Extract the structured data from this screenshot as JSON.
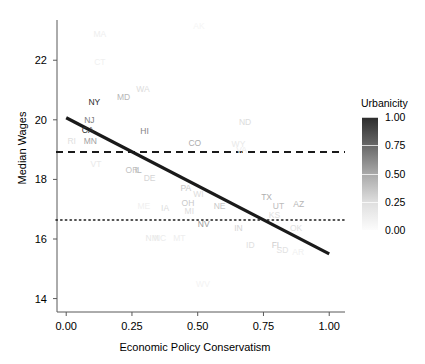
{
  "chart_data": {
    "type": "scatter",
    "title": "",
    "xlabel": "Economic Policy Conservatism",
    "ylabel": "Median Wages",
    "xlim": [
      -0.035,
      1.06
    ],
    "ylim": [
      13.55,
      23.35
    ],
    "xticks": [
      0.0,
      0.25,
      0.5,
      0.75,
      1.0
    ],
    "xticklabels": [
      "0.00",
      "0.25",
      "0.50",
      "0.75",
      "1.00"
    ],
    "yticks": [
      14,
      16,
      18,
      20,
      22
    ],
    "yticklabels": [
      "14",
      "16",
      "18",
      "20",
      "22"
    ],
    "grid": false,
    "legend": {
      "title": "Urbanicity",
      "position": "right",
      "type": "colorbar",
      "ticks": [
        1.0,
        0.75,
        0.5,
        0.25,
        0.0
      ],
      "ticklabels": [
        "1.00",
        "0.75",
        "0.50",
        "0.25",
        "0.00"
      ],
      "color_low": "#fcfcfc",
      "color_high": "#2b2b2b"
    },
    "marker_type": "text-label",
    "points": [
      {
        "label": "AK",
        "x": 0.505,
        "y": 23.15,
        "urbanicity": 0.03
      },
      {
        "label": "MA",
        "x": 0.128,
        "y": 22.88,
        "urbanicity": 0.06
      },
      {
        "label": "CT",
        "x": 0.128,
        "y": 21.95,
        "urbanicity": 0.05
      },
      {
        "label": "WA",
        "x": 0.292,
        "y": 21.05,
        "urbanicity": 0.14
      },
      {
        "label": "MD",
        "x": 0.218,
        "y": 20.75,
        "urbanicity": 0.3
      },
      {
        "label": "NY",
        "x": 0.107,
        "y": 20.6,
        "urbanicity": 0.9
      },
      {
        "label": "NJ",
        "x": 0.088,
        "y": 20.0,
        "urbanicity": 0.55
      },
      {
        "label": "ND",
        "x": 0.68,
        "y": 19.92,
        "urbanicity": 0.14
      },
      {
        "label": "CA",
        "x": 0.082,
        "y": 19.65,
        "urbanicity": 0.88
      },
      {
        "label": "HI",
        "x": 0.298,
        "y": 19.62,
        "urbanicity": 0.52
      },
      {
        "label": "RI",
        "x": 0.021,
        "y": 19.28,
        "urbanicity": 0.12
      },
      {
        "label": "MN",
        "x": 0.092,
        "y": 19.28,
        "urbanicity": 0.4
      },
      {
        "label": "CO",
        "x": 0.489,
        "y": 19.22,
        "urbanicity": 0.34
      },
      {
        "label": "WY",
        "x": 0.655,
        "y": 19.18,
        "urbanicity": 0.08
      },
      {
        "label": "VA",
        "x": 0.667,
        "y": 19.0,
        "urbanicity": 0.07
      },
      {
        "label": "VT",
        "x": 0.113,
        "y": 18.52,
        "urbanicity": 0.08
      },
      {
        "label": "OR",
        "x": 0.25,
        "y": 18.33,
        "urbanicity": 0.25
      },
      {
        "label": "IL",
        "x": 0.274,
        "y": 18.33,
        "urbanicity": 0.3
      },
      {
        "label": "DE",
        "x": 0.317,
        "y": 18.05,
        "urbanicity": 0.17
      },
      {
        "label": "PA",
        "x": 0.455,
        "y": 17.72,
        "urbanicity": 0.22
      },
      {
        "label": "WI",
        "x": 0.503,
        "y": 17.5,
        "urbanicity": 0.14
      },
      {
        "label": "TX",
        "x": 0.762,
        "y": 17.42,
        "urbanicity": 0.33
      },
      {
        "label": "AZ",
        "x": 0.884,
        "y": 17.18,
        "urbanicity": 0.3
      },
      {
        "label": "UT",
        "x": 0.807,
        "y": 17.12,
        "urbanicity": 0.28
      },
      {
        "label": "OH",
        "x": 0.463,
        "y": 17.22,
        "urbanicity": 0.22
      },
      {
        "label": "NE",
        "x": 0.583,
        "y": 17.12,
        "urbanicity": 0.22
      },
      {
        "label": "IA",
        "x": 0.376,
        "y": 17.05,
        "urbanicity": 0.14
      },
      {
        "label": "ME",
        "x": 0.295,
        "y": 17.1,
        "urbanicity": 0.05
      },
      {
        "label": "MI",
        "x": 0.468,
        "y": 16.93,
        "urbanicity": 0.14
      },
      {
        "label": "KS",
        "x": 0.792,
        "y": 16.82,
        "urbanicity": 0.12
      },
      {
        "label": "NV",
        "x": 0.523,
        "y": 16.52,
        "urbanicity": 0.42
      },
      {
        "label": "IN",
        "x": 0.655,
        "y": 16.38,
        "urbanicity": 0.17
      },
      {
        "label": "OK",
        "x": 0.874,
        "y": 16.38,
        "urbanicity": 0.12
      },
      {
        "label": "NM",
        "x": 0.327,
        "y": 16.02,
        "urbanicity": 0.09
      },
      {
        "label": "NC",
        "x": 0.357,
        "y": 16.02,
        "urbanicity": 0.07
      },
      {
        "label": "MT",
        "x": 0.43,
        "y": 16.02,
        "urbanicity": 0.06
      },
      {
        "label": "ID",
        "x": 0.7,
        "y": 15.8,
        "urbanicity": 0.12
      },
      {
        "label": "FL",
        "x": 0.8,
        "y": 15.8,
        "urbanicity": 0.2
      },
      {
        "label": "SD",
        "x": 0.822,
        "y": 15.62,
        "urbanicity": 0.11
      },
      {
        "label": "AR",
        "x": 0.882,
        "y": 15.55,
        "urbanicity": 0.05
      },
      {
        "label": "WV",
        "x": 0.52,
        "y": 14.48,
        "urbanicity": 0.04
      }
    ],
    "fit_line": {
      "style": "solid",
      "color": "#1a1a1a",
      "x0": 0.0,
      "y0": 20.07,
      "x1": 1.0,
      "y1": 15.5
    },
    "reference_lines": [
      {
        "name": "mean-line",
        "style": "dashed",
        "orientation": "horizontal",
        "y": 18.92,
        "color": "#1a1a1a"
      },
      {
        "name": "median-line",
        "style": "dotted",
        "orientation": "horizontal",
        "y": 16.64,
        "color": "#1a1a1a"
      }
    ]
  }
}
